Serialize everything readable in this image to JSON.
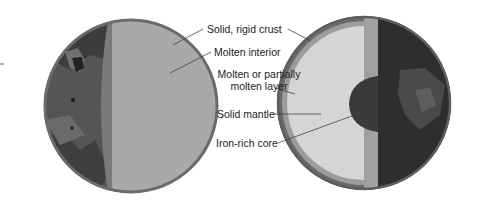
{
  "diagram": {
    "left_planet": {
      "name": "Molten-interior planet",
      "layers": [
        "Solid, rigid crust",
        "Molten interior"
      ]
    },
    "right_planet": {
      "name": "Differentiated planet",
      "layers": [
        "Solid, rigid crust",
        "Molten or partially molten layer",
        "Solid mantle",
        "Iron-rich core"
      ]
    }
  },
  "labels": {
    "crust": "Solid, rigid crust",
    "molten_interior": "Molten interior",
    "partial_line1": "Molten or partially",
    "partial_line2": "molten layer",
    "mantle": "Solid mantle",
    "core": "Iron-rich core"
  },
  "colors": {
    "crust": "#6b6b6b",
    "surface_dark": "#3d3d3d",
    "surface_mid": "#5a5a5a",
    "molten_interior": "#a8a8a8",
    "partial_layer": "#9a9a9a",
    "mantle": "#d6d6d6",
    "core": "#3a3a3a",
    "leader_line": "#444444"
  }
}
